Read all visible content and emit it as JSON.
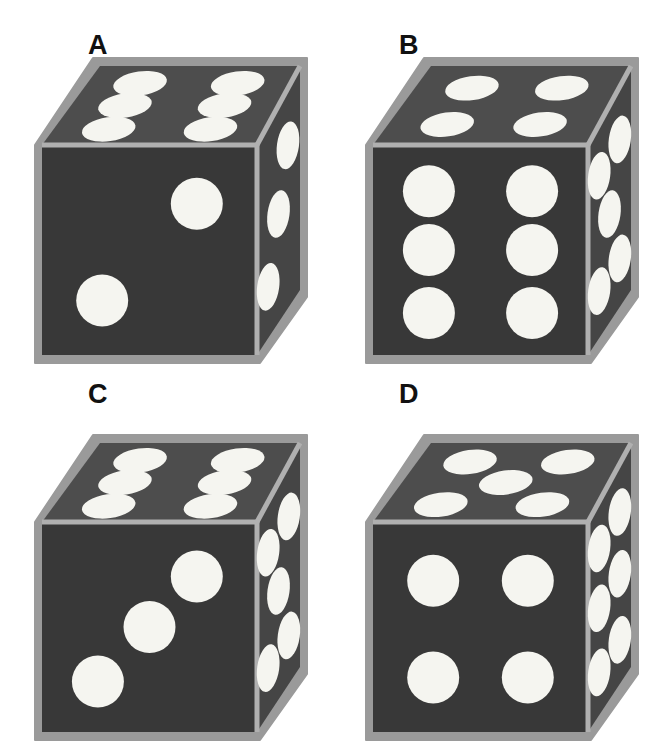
{
  "figure": {
    "title": "",
    "background_color": "#ffffff",
    "layout": "2x2 grid of isometric dice",
    "item_count": 4
  },
  "colors": {
    "background": "#ffffff",
    "die_border": "#9a9a9a",
    "die_edge_highlight": "#b0b0b0",
    "top_face": "#4d4d4d",
    "front_face": "#383838",
    "right_face": "#454545",
    "pip": "#f5f5f0",
    "label_text": "#111111"
  },
  "dice": [
    {
      "label": "A",
      "label_x": 88,
      "label_y": 32,
      "origin_x": 0,
      "origin_y": 0,
      "top_value": 6,
      "front_value": 2,
      "right_value": 3,
      "top_layout": "two-rows-of-three",
      "front_layout": "diagonal-two",
      "right_layout": "diagonal-three"
    },
    {
      "label": "B",
      "label_x": 399,
      "label_y": 32,
      "origin_x": 331,
      "origin_y": 0,
      "top_value": 4,
      "front_value": 6,
      "right_value": 5,
      "top_layout": "four-corners",
      "front_layout": "two-columns-of-three",
      "right_layout": "four-corners-plus-center"
    },
    {
      "label": "C",
      "label_x": 88,
      "label_y": 381,
      "origin_x": 0,
      "origin_y": 377,
      "top_value": 6,
      "front_value": 3,
      "right_value": 5,
      "top_layout": "two-rows-of-three",
      "front_layout": "diagonal-three",
      "right_layout": "four-corners-plus-center"
    },
    {
      "label": "D",
      "label_x": 399,
      "label_y": 381,
      "origin_x": 331,
      "origin_y": 377,
      "top_value": 5,
      "front_value": 4,
      "right_value": 6,
      "top_layout": "four-corners-plus-center",
      "front_layout": "four-corners",
      "right_layout": "two-columns-of-three"
    }
  ],
  "geometry": {
    "note": "Normalized isometric cube within each 331x377 cell",
    "front_face": {
      "x": 42,
      "y": 145,
      "w": 215,
      "h": 210
    },
    "top_face_points": "42,145 100,66 300,66 257,145",
    "right_face_points": "257,145 300,66 300,290 257,355"
  },
  "pip_patterns": {
    "1": [
      [
        0.5,
        0.5
      ]
    ],
    "2": [
      [
        0.72,
        0.28
      ],
      [
        0.28,
        0.74
      ]
    ],
    "3": [
      [
        0.72,
        0.26
      ],
      [
        0.5,
        0.5
      ],
      [
        0.26,
        0.76
      ]
    ],
    "4": [
      [
        0.28,
        0.28
      ],
      [
        0.72,
        0.28
      ],
      [
        0.28,
        0.74
      ],
      [
        0.72,
        0.74
      ]
    ],
    "5": [
      [
        0.26,
        0.24
      ],
      [
        0.74,
        0.24
      ],
      [
        0.5,
        0.5
      ],
      [
        0.26,
        0.78
      ],
      [
        0.74,
        0.78
      ]
    ],
    "6": [
      [
        0.26,
        0.22
      ],
      [
        0.74,
        0.22
      ],
      [
        0.26,
        0.5
      ],
      [
        0.74,
        0.5
      ],
      [
        0.26,
        0.8
      ],
      [
        0.74,
        0.8
      ]
    ]
  }
}
